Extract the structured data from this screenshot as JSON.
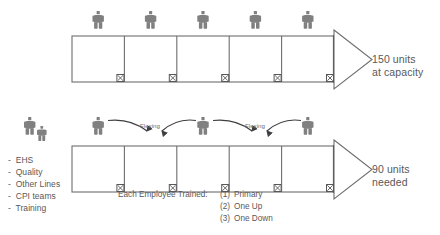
{
  "diagram": {
    "colors": {
      "figure_gray": "#808080",
      "line_gray": "#6d6e70",
      "text_gray": "#58585a",
      "arrow_dark": "#3f3f41",
      "background": "#ffffff"
    },
    "top_row": {
      "name": "full-staffing-line",
      "station_count": 5,
      "operator_count": 5,
      "output_label_line1": "150 units",
      "output_label_line2": "at capacity"
    },
    "bottom_row": {
      "name": "reduced-staffing-line",
      "station_count": 5,
      "operator_count": 3,
      "output_label_line1": "90 units",
      "output_label_line2": "needed",
      "flex_labels": [
        "Flexing",
        "Flexing"
      ]
    },
    "resource_pool": {
      "name": "support-resource-pool",
      "items": [
        "-  EHS",
        "-  Quality",
        "-  Other Lines",
        "-  CPI teams",
        "-  Training"
      ]
    },
    "training_note": {
      "heading": "Each Employee Trained:",
      "items": [
        {
          "num": "(1)",
          "text": "Primary"
        },
        {
          "num": "(2)",
          "text": "One Up"
        },
        {
          "num": "(3)",
          "text": "One Down"
        }
      ]
    }
  }
}
